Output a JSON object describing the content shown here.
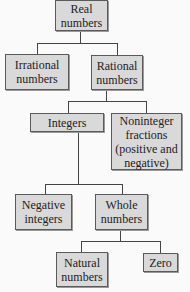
{
  "diagram": {
    "nodes": {
      "real": "Real numbers",
      "irrational": "Irrational numbers",
      "rational": "Rational numbers",
      "integers": "Integers",
      "noninteger": "Noninteger fractions (positive and negative)",
      "negative": "Negative integers",
      "whole": "Whole numbers",
      "natural": "Natural numbers",
      "zero": "Zero"
    },
    "edges": [
      [
        "real",
        "irrational"
      ],
      [
        "real",
        "rational"
      ],
      [
        "rational",
        "integers"
      ],
      [
        "rational",
        "noninteger"
      ],
      [
        "integers",
        "negative"
      ],
      [
        "integers",
        "whole"
      ],
      [
        "whole",
        "natural"
      ],
      [
        "whole",
        "zero"
      ]
    ],
    "colors": {
      "box_fill": "#d9d9d9",
      "border": "#5a5a5a",
      "line": "#444444"
    }
  }
}
